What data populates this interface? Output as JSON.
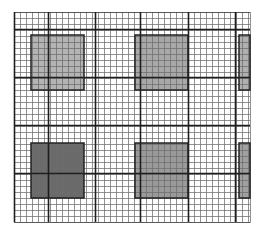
{
  "canvas": {
    "width": 260,
    "height": 233,
    "background": "#ffffff"
  },
  "grid": {
    "x0": 14,
    "y0": 12,
    "x1": 250,
    "y1": 222,
    "minor_spacing": 6,
    "minor_color": "#6e6e6e",
    "minor_width": 1,
    "major_color": "#1e1e1e",
    "major_width": 1.6,
    "major_x": [
      14,
      48,
      95,
      140,
      188,
      235
    ],
    "major_y": [
      29,
      77,
      125,
      173
    ]
  },
  "shaded_blocks": [
    {
      "id": "top-left",
      "x": 31,
      "y": 35,
      "w": 53,
      "h": 55,
      "fill": "#b4b4b4"
    },
    {
      "id": "top-middle",
      "x": 135,
      "y": 35,
      "w": 53,
      "h": 55,
      "fill": "#a8a8a8"
    },
    {
      "id": "top-right-partial",
      "x": 239,
      "y": 35,
      "w": 11,
      "h": 55,
      "fill": "#b0b0b0"
    },
    {
      "id": "bottom-left",
      "x": 31,
      "y": 143,
      "w": 53,
      "h": 55,
      "fill": "#6a6a6a"
    },
    {
      "id": "bottom-middle",
      "x": 135,
      "y": 143,
      "w": 53,
      "h": 55,
      "fill": "#9a9a9a"
    },
    {
      "id": "bottom-right-partial",
      "x": 239,
      "y": 143,
      "w": 11,
      "h": 55,
      "fill": "#a0a0a0"
    }
  ],
  "block_border_color": "#222222"
}
